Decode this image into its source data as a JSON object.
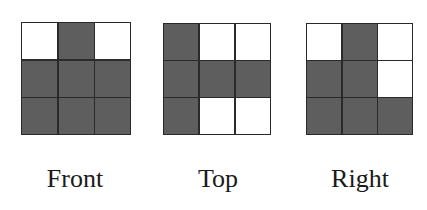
{
  "views": [
    {
      "id": "front",
      "label": "Front",
      "grid": [
        [
          0,
          1,
          0
        ],
        [
          1,
          1,
          1
        ],
        [
          1,
          1,
          1
        ]
      ],
      "box": {
        "left": 21,
        "top": 22,
        "width": 110,
        "height": 113
      },
      "label_center_x": 75
    },
    {
      "id": "top",
      "label": "Top",
      "grid": [
        [
          1,
          0,
          0
        ],
        [
          1,
          1,
          1
        ],
        [
          1,
          0,
          0
        ]
      ],
      "box": {
        "left": 163,
        "top": 23,
        "width": 108,
        "height": 112
      },
      "label_center_x": 218
    },
    {
      "id": "right",
      "label": "Right",
      "grid": [
        [
          0,
          1,
          0
        ],
        [
          1,
          1,
          0
        ],
        [
          1,
          1,
          1
        ]
      ],
      "box": {
        "left": 306,
        "top": 23,
        "width": 107,
        "height": 112
      },
      "label_center_x": 360
    }
  ],
  "colors": {
    "filled": "#5e5e5e",
    "empty": "#ffffff",
    "line": "#2a2a2a"
  },
  "label_top": 166
}
